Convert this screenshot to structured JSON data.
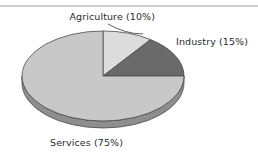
{
  "figure": {
    "background_color": "#ffffff",
    "top_rule": {
      "name": "horizontal-rule",
      "color": "#9a9a9a",
      "y": 6,
      "x1": 0,
      "x2": 258,
      "thickness": 1
    }
  },
  "chart_data": {
    "type": "pie",
    "title": "",
    "subtitle": "",
    "xlabel": "",
    "ylabel": "",
    "legend_position": "none",
    "grid": false,
    "three_d": true,
    "start_angle_deg": 90,
    "direction": "clockwise",
    "categories": [
      "Agriculture",
      "Industry",
      "Services"
    ],
    "values": [
      10,
      15,
      75
    ],
    "value_unit": "%",
    "labels": [
      "Agriculture (10%)",
      "Industry (15%)",
      "Services (75%)"
    ],
    "colors": [
      "#dcdcdc",
      "#6a6a6a",
      "#c8c8c8"
    ],
    "side_colors": [
      "#b4b4b4",
      "#4e4e4e",
      "#8e8e8e"
    ],
    "edge_color": "#4a4a4a",
    "slices": [
      {
        "name": "Agriculture",
        "label": "Agriculture (10%)",
        "value": 10,
        "color": "#dcdcdc",
        "start_deg": 0,
        "sweep_deg": 36
      },
      {
        "name": "Industry",
        "label": "Industry (15%)",
        "value": 15,
        "color": "#6a6a6a",
        "start_deg": 36,
        "sweep_deg": 54
      },
      {
        "name": "Services",
        "label": "Services (75%)",
        "value": 75,
        "color": "#c8c8c8",
        "start_deg": 90,
        "sweep_deg": 270
      }
    ]
  },
  "geometry": {
    "center_x": 103,
    "center_y": 76,
    "radius_x": 81,
    "radius_y": 45,
    "depth": 7
  },
  "annotations": {
    "agriculture": {
      "text": "Agriculture (10%)",
      "text_x": 155,
      "text_y": 20,
      "anchor": "end",
      "leader": {
        "x1": 108,
        "y1": 24,
        "x2": 143,
        "y2": 34
      }
    },
    "industry": {
      "text": "Industry (15%)",
      "text_x": 176,
      "text_y": 45,
      "anchor": "start",
      "leader": null
    },
    "services": {
      "text": "Services (75%)",
      "text_x": 50,
      "text_y": 146,
      "anchor": "start",
      "leader": null
    }
  }
}
